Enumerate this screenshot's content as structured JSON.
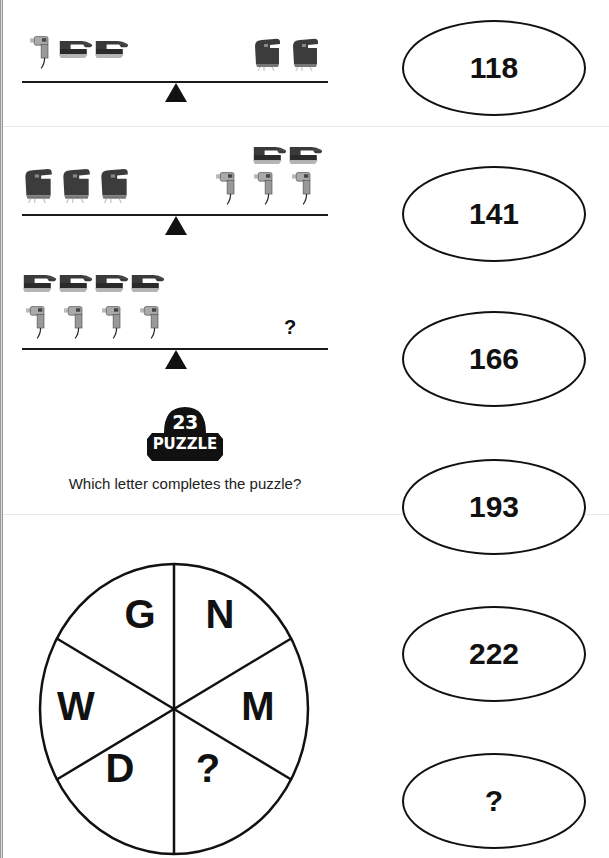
{
  "scales": [
    {
      "left_pan": [
        "drill",
        "sander",
        "sander"
      ],
      "right_pan": [
        "jigsaw",
        "jigsaw"
      ],
      "balanced": true
    },
    {
      "left_pan": [
        "jigsaw",
        "jigsaw",
        "jigsaw"
      ],
      "right_pan": [
        "sander",
        "sander",
        "drill",
        "drill",
        "drill"
      ],
      "balanced": true
    },
    {
      "left_pan": [
        "sander",
        "sander",
        "sander",
        "sander",
        "drill",
        "drill",
        "drill",
        "drill"
      ],
      "right_pan": [
        "?"
      ],
      "right_label": "?",
      "balanced": true
    }
  ],
  "puzzle_badge": {
    "number": "23",
    "label": "PUZZLE"
  },
  "question": "Which letter completes the puzzle?",
  "wheel": {
    "segments": [
      "G",
      "N",
      "M",
      "?",
      "D",
      "W"
    ]
  },
  "number_sequence": [
    "118",
    "141",
    "166",
    "193",
    "222",
    "?"
  ],
  "colors": {
    "ink": "#111111",
    "background": "#ffffff",
    "tool_dark": "#3a3a3a",
    "tool_light": "#c8c8c8"
  }
}
